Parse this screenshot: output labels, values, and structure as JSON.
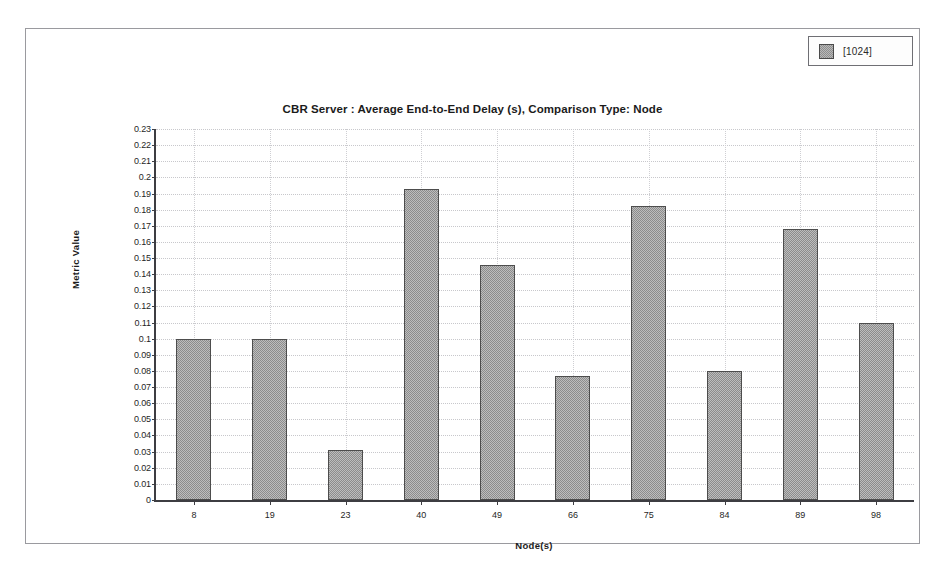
{
  "window": {
    "background_color": "#ffffff",
    "border_color": "#9a9a9f"
  },
  "legend": {
    "position": "top-right",
    "entries": [
      {
        "label": "[1024]",
        "swatch": "checkered-gray-swatch",
        "color": "#b9b9b9"
      }
    ]
  },
  "chart_data": {
    "type": "bar",
    "title": "CBR Server :  Average End-to-End Delay (s), Comparison Type: Node",
    "xlabel": "Node(s)",
    "ylabel": "Metric Value",
    "categories": [
      "8",
      "19",
      "23",
      "40",
      "49",
      "66",
      "75",
      "84",
      "89",
      "98"
    ],
    "series": [
      {
        "name": "[1024]",
        "values": [
          0.1,
          0.1,
          0.031,
          0.193,
          0.146,
          0.077,
          0.182,
          0.08,
          0.168,
          0.11
        ]
      }
    ],
    "ylim": [
      0,
      0.23
    ],
    "ytick_step": 0.01,
    "ytick_labels": [
      "0.23",
      "0.22",
      "0.21",
      "0.2",
      "0.19",
      "0.18",
      "0.17",
      "0.16",
      "0.15",
      "0.14",
      "0.13",
      "0.12",
      "0.11",
      "0.1",
      "0.09",
      "0.08",
      "0.07",
      "0.06",
      "0.05",
      "0.04",
      "0.03",
      "0.02",
      "0.01",
      "0"
    ],
    "grid": true,
    "legend_position": "top-right",
    "bar_fill_color": "#bdbdbd",
    "bar_border_color": "#4d4d4d",
    "axis_color": "#3d3d42",
    "grid_color": "#c8c8cc"
  }
}
